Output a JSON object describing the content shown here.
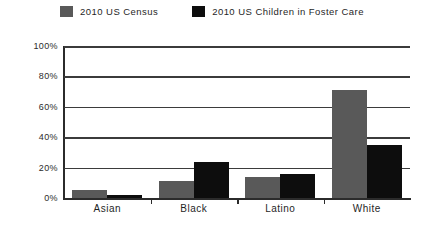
{
  "chart_data": {
    "type": "bar",
    "title": "",
    "subtitle": "",
    "xlabel": "",
    "ylabel": "",
    "categories": [
      "Asian",
      "Black",
      "Latino",
      "White"
    ],
    "series": [
      {
        "name": "2010 US Census",
        "color": "#595959",
        "values": [
          5,
          11,
          14,
          71
        ]
      },
      {
        "name": "2010 US Children in Foster Care",
        "color": "#0d0d0d",
        "values": [
          2,
          24,
          16,
          35
        ]
      }
    ],
    "ylim": [
      0,
      100
    ],
    "yticks": [
      0,
      20,
      40,
      60,
      80,
      100
    ],
    "ytick_labels": [
      "0%",
      "20%",
      "40%",
      "60%",
      "80%",
      "100%"
    ],
    "value_suffix": "%",
    "grid": true,
    "grid_axis": "y",
    "legend_position": "top",
    "bar_orientation": "vertical",
    "grouped": true
  },
  "legend": {
    "items": [
      {
        "label": "2010 US Census",
        "color": "#595959"
      },
      {
        "label": "2010 US Children in Foster Care",
        "color": "#0d0d0d"
      }
    ]
  },
  "colors": {
    "background": "#ffffff",
    "axis": "#2b2b2b",
    "gridline": "#3b3b3b",
    "series_census": "#595959",
    "series_foster": "#0d0d0d",
    "text": "#1f1f1f"
  }
}
